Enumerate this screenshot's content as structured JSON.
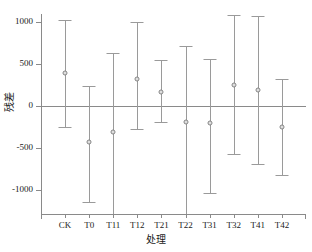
{
  "chart_data": {
    "type": "scatter",
    "title": "",
    "xlabel": "处理",
    "ylabel": "残差",
    "categories": [
      "CK",
      "T0",
      "T11",
      "T12",
      "T21",
      "T22",
      "T31",
      "T32",
      "T41",
      "T42"
    ],
    "values": [
      390,
      -430,
      -320,
      320,
      160,
      -190,
      -210,
      250,
      190,
      -260
    ],
    "error_upper": [
      1020,
      230,
      630,
      990,
      540,
      710,
      560,
      1080,
      1070,
      320
    ],
    "error_lower": [
      -250,
      -1150,
      -1290,
      -280,
      -190,
      -1330,
      -1040,
      -580,
      -700,
      -820
    ],
    "yticks": [
      1000,
      500,
      0,
      -500,
      -1000
    ],
    "ytick_labels": [
      "1000",
      "500",
      "0",
      "-500",
      "-1000"
    ],
    "ylim": [
      -1290,
      1090
    ],
    "xlim": [
      0,
      11
    ],
    "grid": false,
    "legend": false,
    "zero_reference_line": 0,
    "marker": "open-circle",
    "series_name": "残差",
    "colors": {
      "axis": "#8a8a8a",
      "errorbar": "#9a9a9a",
      "marker_edge": "#7d7d7d",
      "marker_face": "#ffffff",
      "text": "#1a1a1a",
      "background": "#ffffff"
    }
  }
}
